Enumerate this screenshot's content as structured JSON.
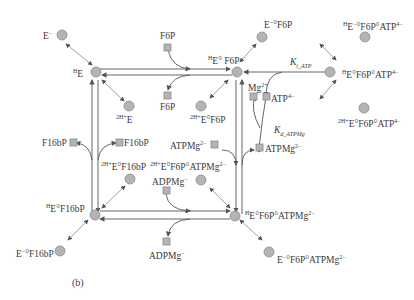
{
  "figure": {
    "panel_label": "(b)",
    "colors": {
      "node_fill": "#b4b4b4",
      "node_stroke": "#8a8a8a",
      "line": "#555555",
      "arrow": "#777777"
    }
  },
  "nodes": {
    "HE": {
      "pre": "H",
      "main": "E"
    },
    "E_minus": {
      "main": "E",
      "sup": "−"
    },
    "2HE": {
      "pre": "2H+",
      "main": "E"
    },
    "HEF6P": {
      "pre": "H",
      "main": "E° F6P"
    },
    "EF6P_minus": {
      "main": "E",
      "sup": "−",
      "rest": "°F6P"
    },
    "2HEF6P": {
      "pre": "2H+",
      "main": "E°F6P"
    },
    "HEF6PATP": {
      "pre": "H",
      "main": "E°F6P°ATP",
      "sup": "4−"
    },
    "EF6PATP_minus": {
      "pre": "H",
      "main": "E",
      "sup": "−",
      "rest": "°F6P°ATP",
      "sup2": "4−"
    },
    "2HEF6PATP": {
      "pre": "2H+",
      "main": "E°F6P°ATP",
      "sup": "4−"
    },
    "HEF16bP": {
      "pre": "H",
      "main": "E°F16bP"
    },
    "EF16bP_minus": {
      "main": "E",
      "sup": "−",
      "rest": "°F16bP"
    },
    "2HEF16bP": {
      "pre": "2H+",
      "main": "E°F16bP"
    },
    "HEF6PATPMg": {
      "pre": "H",
      "main": "E°F6P°ATPMg",
      "sup": "2−"
    },
    "EF6PATPMg_minus": {
      "main": "E",
      "sup": "−",
      "rest": "°F6P°ATPMg",
      "sup2": "2−"
    },
    "2HEF6PATPMg": {
      "pre": "2H+",
      "main": "E°F6P°ATPMg",
      "sup": "2−"
    }
  },
  "species": {
    "F6P_in": "F6P",
    "F6P_out": "F6P",
    "F16bP_left": "F16bP",
    "F16bP_right": "F16bP",
    "ATPMg_left": {
      "main": "ATPMg",
      "sup": "2−"
    },
    "ATPMg_right": {
      "main": "ATPMg",
      "sup": "2−"
    },
    "ADPMg_in": {
      "main": "ADPMg",
      "sup": "−"
    },
    "ADPMg_out": {
      "main": "ADPMg",
      "sup": "−"
    },
    "Mg": {
      "main": "Mg",
      "sup": "2+"
    },
    "ATP": {
      "main": "ATP",
      "sup": "4−"
    }
  },
  "constants": {
    "Ki_ATP": {
      "main": "K",
      "sub": "i_ATP"
    },
    "Kd_ATPMg": {
      "main": "K",
      "sub": "d_ATPMg"
    }
  }
}
